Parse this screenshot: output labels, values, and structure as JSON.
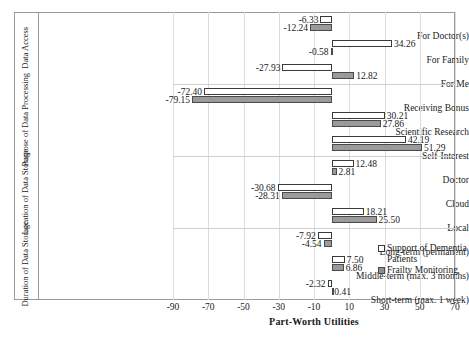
{
  "chart_data": {
    "type": "bar",
    "orientation": "horizontal",
    "title": "",
    "xlabel": "Part-Worth Utilities",
    "ylabel": "",
    "xlim": [
      -90,
      70
    ],
    "xticks": [
      -90,
      -70,
      -50,
      -30,
      -10,
      10,
      30,
      50,
      70
    ],
    "grid": true,
    "legend_position": "right",
    "categories": [
      "For Doctor(s)",
      "For Family",
      "For Me",
      "Receiving Bonus",
      "Scientific Research",
      "Self-Interest",
      "Doctor",
      "Cloud",
      "Local",
      "Long-term (permanent)",
      "Middle-term (max. 3 months)",
      "Short-term (max. 1 week)"
    ],
    "groups": [
      {
        "label": "Data Access",
        "categories": [
          "For Doctor(s)",
          "For Family",
          "For Me"
        ]
      },
      {
        "label": "Purpose of Data Processing",
        "categories": [
          "Receiving Bonus",
          "Scientific Research",
          "Self-Interest"
        ]
      },
      {
        "label": "Location of Data Storage",
        "categories": [
          "Doctor",
          "Cloud",
          "Local"
        ]
      },
      {
        "label": "Duration of Data Storage",
        "categories": [
          "Long-term (permanent)",
          "Middle-term (max. 3 months)",
          "Short-term (max. 1 week)"
        ]
      }
    ],
    "series": [
      {
        "name": "Support of Dementia Patients",
        "style": "white",
        "values": [
          -6.33,
          34.26,
          -27.93,
          -72.4,
          30.21,
          42.19,
          12.48,
          -30.68,
          18.21,
          -7.92,
          7.5,
          -2.32
        ]
      },
      {
        "name": "Frailty Monitoring",
        "style": "gray",
        "values": [
          -12.24,
          -0.58,
          12.82,
          -79.15,
          27.86,
          51.29,
          2.81,
          -28.31,
          25.5,
          -4.54,
          6.86,
          0.41
        ]
      }
    ],
    "value_labels": {
      "series_0": [
        "-6.33",
        "34.26",
        "-27.93",
        "-72.40",
        "30.21",
        "42.19",
        "12.48",
        "-30.68",
        "18.21",
        "-7.92",
        "7.50",
        "-2.32"
      ],
      "series_1": [
        "-12.24",
        "-0.58",
        "12.82",
        "-79.15",
        "27.86",
        "51.29",
        "2.81",
        "-28.31",
        "25.50",
        "-4.54",
        "6.86",
        "0.41"
      ]
    },
    "colors": {
      "support_of_dementia_patients": "#ffffff",
      "frailty_monitoring": "#9a9a9a",
      "bar_outline": "#3a3a3a",
      "gridline": "#dcdcdc",
      "frame": "#9a9a9a",
      "text": "#1a1a1a"
    }
  },
  "legend": {
    "items": [
      {
        "label": "Support of Dementia Patients",
        "style": "white"
      },
      {
        "label": "Frailty Monitoring",
        "style": "gray"
      }
    ]
  },
  "axis": {
    "x_title": "Part-Worth Utilities",
    "x_tick_labels": [
      "-90",
      "-70",
      "-50",
      "-30",
      "-10",
      "10",
      "30",
      "50",
      "70"
    ]
  }
}
